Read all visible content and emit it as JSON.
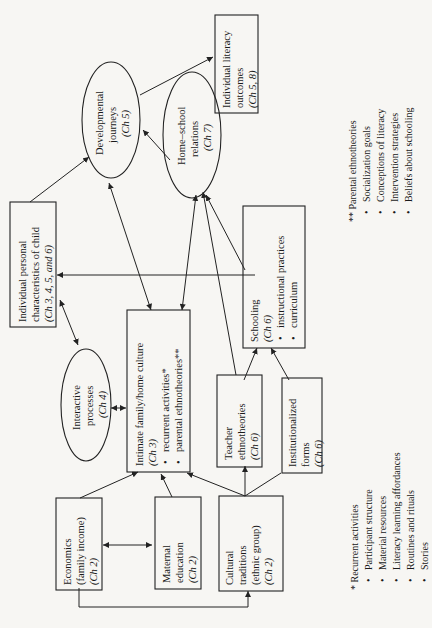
{
  "diagram": {
    "orientation": "rotated-90-ccw",
    "nodes": {
      "economics": {
        "line1": "Economics",
        "line2": "(family income)",
        "chapter": "(Ch 2)"
      },
      "maternal": {
        "line1": "Maternal",
        "line2": "education",
        "chapter": "(Ch 2)"
      },
      "cultural": {
        "line1": "Cultural",
        "line2": "traditions",
        "line3": "(ethnic group)",
        "chapter": "(Ch 2)"
      },
      "intimate": {
        "title": "Intimate family/home culture",
        "chapter": "(Ch 3)",
        "bullets": [
          "recurrent activities*",
          "parental ethnotheories**"
        ]
      },
      "interactive": {
        "line1": "Interactive",
        "line2": "processes",
        "chapter": "(Ch 4)"
      },
      "personal": {
        "line1": "Individual personal",
        "line2": "characteristics of child",
        "chapter": "(Ch 3, 4, 5, and 6)"
      },
      "teacher": {
        "line1": "Teacher",
        "line2": "ethnotheories",
        "chapter": "(Ch 6)"
      },
      "institutional": {
        "line1": "Institutionalized",
        "line2": "forms",
        "chapter": "(Ch 6)"
      },
      "schooling": {
        "title": "Schooling",
        "chapter": "(Ch 6)",
        "bullets": [
          "instructional practices",
          "curriculum"
        ]
      },
      "homeschool": {
        "line1": "Home–school",
        "line2": "relations",
        "chapter": "(Ch 7)"
      },
      "developmental": {
        "line1": "Developmental",
        "line2": "journeys",
        "chapter": "(Ch 5)"
      },
      "outcomes": {
        "line1": "Individual literacy",
        "line2": "outcomes",
        "chapter": "(Ch 5, 8)"
      }
    },
    "legend_recurrent": {
      "title": "* Recurrent activities",
      "items": [
        "Participant structure",
        "Material resources",
        "Literacy learning affordances",
        "Routines and rituals",
        "Stories"
      ]
    },
    "legend_parental": {
      "title": "** Parental ethnotheories",
      "items": [
        "Socialization goals",
        "Conceptions of literacy",
        "Intervention strategies",
        "Beliefs about schooling"
      ]
    },
    "colors": {
      "ink": "#1a1a1a",
      "paper": "#f7f6f3"
    }
  }
}
